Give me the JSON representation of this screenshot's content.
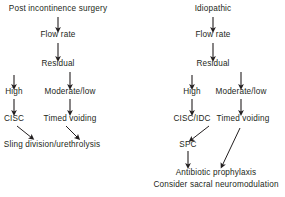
{
  "diagram": {
    "type": "flowchart",
    "title_visible": false,
    "background_color": "#ffffff",
    "text_color": "#231f20",
    "arrow_color": "#231f20",
    "branches": [
      {
        "id": "left",
        "root_label": "Post incontinence surgery",
        "nodes": [
          {
            "id": "l-root",
            "label": "Post incontinence surgery",
            "x": 58,
            "y": 10
          },
          {
            "id": "l-flow",
            "label": "Flow rate",
            "x": 58,
            "y": 36
          },
          {
            "id": "l-residual",
            "label": "Residual",
            "x": 58,
            "y": 65
          },
          {
            "id": "l-high",
            "label": "High",
            "x": 14,
            "y": 93
          },
          {
            "id": "l-modlow",
            "label": "Moderate/low",
            "x": 70,
            "y": 93
          },
          {
            "id": "l-cisc",
            "label": "CISC",
            "x": 14,
            "y": 120
          },
          {
            "id": "l-timed",
            "label": "Timed voiding",
            "x": 70,
            "y": 120
          },
          {
            "id": "l-sling",
            "label": "Sling division/urethrolysis",
            "x": 52,
            "y": 146
          }
        ]
      },
      {
        "id": "right",
        "root_label": "Idiopathic",
        "nodes": [
          {
            "id": "r-root",
            "label": "Idiopathic",
            "x": 213,
            "y": 10
          },
          {
            "id": "r-flow",
            "label": "Flow rate",
            "x": 213,
            "y": 36
          },
          {
            "id": "r-residual",
            "label": "Residual",
            "x": 213,
            "y": 65
          },
          {
            "id": "r-high",
            "label": "High",
            "x": 192,
            "y": 93
          },
          {
            "id": "r-modlow",
            "label": "Moderate/low",
            "x": 241,
            "y": 93
          },
          {
            "id": "r-ciscidc",
            "label": "CISC/IDC",
            "x": 192,
            "y": 120
          },
          {
            "id": "r-timed",
            "label": "Timed voiding",
            "x": 243,
            "y": 120
          },
          {
            "id": "r-spc",
            "label": "SPC",
            "x": 188,
            "y": 146
          },
          {
            "id": "r-antibiotic",
            "label": "Antibiotic prophylaxis",
            "x": 216,
            "y": 174
          },
          {
            "id": "r-neuromod",
            "label": "Consider sacral neuromodulation",
            "x": 216,
            "y": 186
          }
        ]
      }
    ],
    "connectors": [
      {
        "from": "l-root",
        "to": "l-flow",
        "kind": "vertical"
      },
      {
        "from": "l-flow",
        "to": "l-residual",
        "kind": "vertical"
      },
      {
        "from": "l-residual",
        "to": "l-high",
        "kind": "vertical"
      },
      {
        "from": "l-residual",
        "to": "l-modlow",
        "kind": "vertical"
      },
      {
        "from": "l-high",
        "to": "l-cisc",
        "kind": "vertical"
      },
      {
        "from": "l-modlow",
        "to": "l-timed",
        "kind": "vertical"
      },
      {
        "from": "l-cisc",
        "to": "l-sling",
        "kind": "diagonal"
      },
      {
        "from": "l-timed",
        "to": "l-sling",
        "kind": "diagonal"
      },
      {
        "from": "r-root",
        "to": "r-flow",
        "kind": "vertical"
      },
      {
        "from": "r-flow",
        "to": "r-residual",
        "kind": "vertical"
      },
      {
        "from": "r-residual",
        "to": "r-high",
        "kind": "vertical"
      },
      {
        "from": "r-residual",
        "to": "r-modlow",
        "kind": "vertical"
      },
      {
        "from": "r-high",
        "to": "r-ciscidc",
        "kind": "vertical"
      },
      {
        "from": "r-modlow",
        "to": "r-timed",
        "kind": "vertical"
      },
      {
        "from": "r-ciscidc",
        "to": "r-spc",
        "kind": "diagonal"
      },
      {
        "from": "r-spc",
        "to": "r-antibiotic",
        "kind": "vertical"
      },
      {
        "from": "r-timed",
        "to": "r-antibiotic",
        "kind": "diagonal"
      }
    ]
  }
}
